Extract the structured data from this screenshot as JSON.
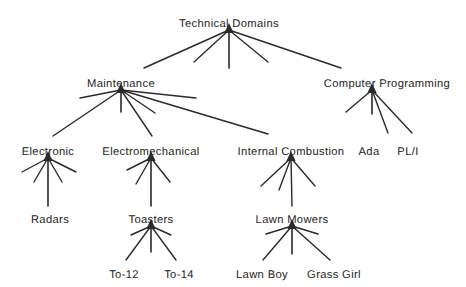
{
  "diagram": {
    "type": "tree-hierarchy",
    "title_node": "Technical Domains",
    "style": {
      "line_color": "#2a2a2a",
      "text_color": "#232323",
      "background": "#ffffff",
      "arrowheads": "upward-pointing at each parent node"
    },
    "nodes": [
      {
        "id": "technical-domains",
        "label": "Technical Domains",
        "x": 229,
        "y": 18,
        "apex_x": 229,
        "apex_y": 29,
        "level": 0
      },
      {
        "id": "maintenance",
        "label": "Maintenance",
        "x": 121,
        "y": 78,
        "apex_x": 121,
        "apex_y": 89,
        "level": 1
      },
      {
        "id": "computer-programming",
        "label": "Computer Programming",
        "x": 387,
        "y": 78,
        "apex_x": 372,
        "apex_y": 89,
        "level": 1
      },
      {
        "id": "electronic",
        "label": "Electronic",
        "x": 48,
        "y": 146,
        "apex_x": 48,
        "apex_y": 157,
        "level": 2
      },
      {
        "id": "electromechanical",
        "label": "Electromechanical",
        "x": 151,
        "y": 146,
        "apex_x": 151,
        "apex_y": 157,
        "level": 2
      },
      {
        "id": "internal-combustion",
        "label": "Internal Combustion",
        "x": 291,
        "y": 146,
        "apex_x": 291,
        "apex_y": 157,
        "level": 2
      },
      {
        "id": "ada",
        "label": "Ada",
        "x": 369,
        "y": 146,
        "apex_x": 369,
        "apex_y": 141,
        "level": 2
      },
      {
        "id": "pl-i",
        "label": "PL/I",
        "x": 408,
        "y": 146,
        "apex_x": 408,
        "apex_y": 141,
        "level": 2
      },
      {
        "id": "radars",
        "label": "Radars",
        "x": 50,
        "y": 214,
        "apex_x": 50,
        "apex_y": 209,
        "level": 3
      },
      {
        "id": "toasters",
        "label": "Toasters",
        "x": 151,
        "y": 214,
        "apex_x": 151,
        "apex_y": 225,
        "level": 3
      },
      {
        "id": "lawn-mowers",
        "label": "Lawn Mowers",
        "x": 292,
        "y": 214,
        "apex_x": 292,
        "apex_y": 225,
        "level": 3
      },
      {
        "id": "to-12",
        "label": "To-12",
        "x": 124,
        "y": 269,
        "apex_x": 124,
        "apex_y": 264,
        "level": 4
      },
      {
        "id": "to-14",
        "label": "To-14",
        "x": 179,
        "y": 269,
        "apex_x": 179,
        "apex_y": 264,
        "level": 4
      },
      {
        "id": "lawn-boy",
        "label": "Lawn Boy",
        "x": 262,
        "y": 269,
        "apex_x": 262,
        "apex_y": 264,
        "level": 4
      },
      {
        "id": "grass-girl",
        "label": "Grass Girl",
        "x": 334,
        "y": 269,
        "apex_x": 334,
        "apex_y": 264,
        "level": 4
      }
    ],
    "edges": [
      {
        "from": "technical-domains",
        "to": "maintenance",
        "x1": 229,
        "y1": 30,
        "x2": 144,
        "y2": 68,
        "labeled_child": true
      },
      {
        "from": "technical-domains",
        "to": null,
        "x1": 229,
        "y1": 30,
        "x2": 194,
        "y2": 62,
        "labeled_child": false
      },
      {
        "from": "technical-domains",
        "to": null,
        "x1": 229,
        "y1": 30,
        "x2": 229,
        "y2": 68,
        "labeled_child": false
      },
      {
        "from": "technical-domains",
        "to": null,
        "x1": 229,
        "y1": 30,
        "x2": 268,
        "y2": 62,
        "labeled_child": false
      },
      {
        "from": "technical-domains",
        "to": "computer-programming",
        "x1": 229,
        "y1": 30,
        "x2": 341,
        "y2": 68,
        "labeled_child": true
      },
      {
        "from": "maintenance",
        "to": "electronic",
        "x1": 121,
        "y1": 90,
        "x2": 53,
        "y2": 136,
        "labeled_child": true
      },
      {
        "from": "maintenance",
        "to": null,
        "x1": 121,
        "y1": 90,
        "x2": 121,
        "y2": 112,
        "labeled_child": false
      },
      {
        "from": "maintenance",
        "to": "electromechanical",
        "x1": 121,
        "y1": 90,
        "x2": 152,
        "y2": 136,
        "labeled_child": true
      },
      {
        "from": "maintenance",
        "to": null,
        "x1": 121,
        "y1": 90,
        "x2": 155,
        "y2": 113,
        "labeled_child": false
      },
      {
        "from": "maintenance",
        "to": "internal-combustion",
        "x1": 121,
        "y1": 90,
        "x2": 268,
        "y2": 134,
        "labeled_child": true
      },
      {
        "from": "maintenance",
        "to": null,
        "x1": 121,
        "y1": 90,
        "x2": 80,
        "y2": 98,
        "labeled_child": false
      },
      {
        "from": "maintenance",
        "to": null,
        "x1": 121,
        "y1": 90,
        "x2": 196,
        "y2": 98,
        "labeled_child": false
      },
      {
        "from": "computer-programming",
        "to": null,
        "x1": 372,
        "y1": 90,
        "x2": 346,
        "y2": 112,
        "labeled_child": false
      },
      {
        "from": "computer-programming",
        "to": null,
        "x1": 372,
        "y1": 90,
        "x2": 372,
        "y2": 114,
        "labeled_child": false
      },
      {
        "from": "computer-programming",
        "to": "ada",
        "x1": 372,
        "y1": 90,
        "x2": 388,
        "y2": 133,
        "labeled_child": true
      },
      {
        "from": "computer-programming",
        "to": "pl-i",
        "x1": 372,
        "y1": 90,
        "x2": 412,
        "y2": 133,
        "labeled_child": true
      },
      {
        "from": "electronic",
        "to": null,
        "x1": 48,
        "y1": 158,
        "x2": 22,
        "y2": 172,
        "labeled_child": false
      },
      {
        "from": "electronic",
        "to": null,
        "x1": 48,
        "y1": 158,
        "x2": 34,
        "y2": 182,
        "labeled_child": false
      },
      {
        "from": "electronic",
        "to": "radars",
        "x1": 48,
        "y1": 158,
        "x2": 48,
        "y2": 206,
        "labeled_child": true
      },
      {
        "from": "electronic",
        "to": null,
        "x1": 48,
        "y1": 158,
        "x2": 62,
        "y2": 182,
        "labeled_child": false
      },
      {
        "from": "electronic",
        "to": null,
        "x1": 48,
        "y1": 158,
        "x2": 76,
        "y2": 172,
        "labeled_child": false
      },
      {
        "from": "electromechanical",
        "to": null,
        "x1": 151,
        "y1": 158,
        "x2": 127,
        "y2": 170,
        "labeled_child": false
      },
      {
        "from": "electromechanical",
        "to": null,
        "x1": 151,
        "y1": 158,
        "x2": 136,
        "y2": 184,
        "labeled_child": false
      },
      {
        "from": "electromechanical",
        "to": "toasters",
        "x1": 151,
        "y1": 158,
        "x2": 151,
        "y2": 206,
        "labeled_child": true
      },
      {
        "from": "electromechanical",
        "to": null,
        "x1": 151,
        "y1": 158,
        "x2": 170,
        "y2": 182,
        "labeled_child": false
      },
      {
        "from": "internal-combustion",
        "to": null,
        "x1": 291,
        "y1": 158,
        "x2": 261,
        "y2": 186,
        "labeled_child": false
      },
      {
        "from": "internal-combustion",
        "to": null,
        "x1": 291,
        "y1": 158,
        "x2": 279,
        "y2": 190,
        "labeled_child": false
      },
      {
        "from": "internal-combustion",
        "to": "lawn-mowers",
        "x1": 291,
        "y1": 158,
        "x2": 292,
        "y2": 206,
        "labeled_child": true
      },
      {
        "from": "internal-combustion",
        "to": null,
        "x1": 291,
        "y1": 158,
        "x2": 315,
        "y2": 186,
        "labeled_child": false
      },
      {
        "from": "toasters",
        "to": "to-12",
        "x1": 151,
        "y1": 226,
        "x2": 126,
        "y2": 260,
        "labeled_child": true
      },
      {
        "from": "toasters",
        "to": null,
        "x1": 151,
        "y1": 226,
        "x2": 151,
        "y2": 252,
        "labeled_child": false
      },
      {
        "from": "toasters",
        "to": "to-14",
        "x1": 151,
        "y1": 226,
        "x2": 176,
        "y2": 260,
        "labeled_child": true
      },
      {
        "from": "toasters",
        "to": null,
        "x1": 151,
        "y1": 226,
        "x2": 131,
        "y2": 235,
        "labeled_child": false
      },
      {
        "from": "toasters",
        "to": null,
        "x1": 151,
        "y1": 226,
        "x2": 171,
        "y2": 235,
        "labeled_child": false
      },
      {
        "from": "lawn-mowers",
        "to": "lawn-boy",
        "x1": 292,
        "y1": 226,
        "x2": 263,
        "y2": 260,
        "labeled_child": true
      },
      {
        "from": "lawn-mowers",
        "to": null,
        "x1": 292,
        "y1": 226,
        "x2": 292,
        "y2": 254,
        "labeled_child": false
      },
      {
        "from": "lawn-mowers",
        "to": "grass-girl",
        "x1": 292,
        "y1": 226,
        "x2": 330,
        "y2": 260,
        "labeled_child": true
      },
      {
        "from": "lawn-mowers",
        "to": null,
        "x1": 292,
        "y1": 226,
        "x2": 266,
        "y2": 234,
        "labeled_child": false
      },
      {
        "from": "lawn-mowers",
        "to": null,
        "x1": 292,
        "y1": 226,
        "x2": 318,
        "y2": 234,
        "labeled_child": false
      }
    ],
    "arrowheads": [
      {
        "at": "technical-domains",
        "x": 229,
        "y": 29,
        "direction": "up"
      },
      {
        "at": "maintenance",
        "x": 121,
        "y": 89,
        "direction": "up"
      },
      {
        "at": "computer-programming",
        "x": 372,
        "y": 89,
        "direction": "up"
      },
      {
        "at": "electronic",
        "x": 48,
        "y": 157,
        "direction": "up"
      },
      {
        "at": "electromechanical",
        "x": 151,
        "y": 157,
        "direction": "up"
      },
      {
        "at": "internal-combustion",
        "x": 291,
        "y": 157,
        "direction": "up"
      },
      {
        "at": "toasters",
        "x": 151,
        "y": 225,
        "direction": "up"
      },
      {
        "at": "lawn-mowers",
        "x": 292,
        "y": 225,
        "direction": "up"
      }
    ]
  }
}
